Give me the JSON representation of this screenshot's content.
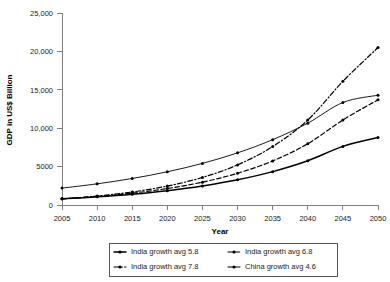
{
  "chart_data": {
    "type": "line",
    "title": "",
    "xlabel": "Year",
    "ylabel": "GDP in US$ Billion",
    "xlim": [
      2005,
      2050
    ],
    "ylim": [
      0,
      25000
    ],
    "grid": false,
    "legend_position": "bottom",
    "x": [
      2005,
      2010,
      2015,
      2020,
      2025,
      2030,
      2035,
      2040,
      2045,
      2050
    ],
    "xtick_labels": [
      "2005",
      "2010",
      "2015",
      "2020",
      "2025",
      "2030",
      "2035",
      "2040",
      "2045",
      "2050"
    ],
    "ytick_values": [
      0,
      5000,
      10000,
      15000,
      20000,
      25000
    ],
    "ytick_labels": [
      "0",
      "5000",
      "10,000",
      "15,000",
      "20,000",
      "25,000"
    ],
    "series": [
      {
        "name": "India growth avg  5.8",
        "line_style": "solid",
        "line_width": 1.5,
        "values": [
          800,
          1060,
          1405,
          1863,
          2470,
          3275,
          4342,
          5757,
          7633,
          8800
        ]
      },
      {
        "name": "India growth avg  6.8",
        "line_style": "dashed",
        "line_width": 1.2,
        "values": [
          800,
          1111,
          1543,
          2143,
          2976,
          4133,
          5740,
          7971,
          11070,
          13700
        ]
      },
      {
        "name": "India growth avg  7.8",
        "line_style": "dash-dot",
        "line_width": 1.2,
        "values": [
          800,
          1164,
          1694,
          2466,
          3589,
          5223,
          7601,
          11063,
          16100,
          20500
        ]
      },
      {
        "name": "China growth avg 4.6",
        "line_style": "solid",
        "line_width": 0.9,
        "values": [
          2200,
          2756,
          3453,
          4326,
          5419,
          6789,
          8505,
          10655,
          13348,
          14300
        ]
      }
    ],
    "legend_entries": [
      "India growth avg  5.8",
      "India growth avg  6.8",
      "India growth avg  7.8",
      "China growth avg 4.6"
    ]
  }
}
